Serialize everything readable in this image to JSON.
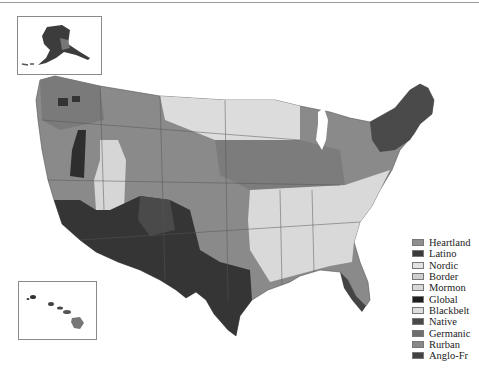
{
  "map": {
    "title": "",
    "subject": "US counties by cultural region",
    "insets": [
      "Alaska",
      "Hawaii"
    ]
  },
  "legend": {
    "items": [
      {
        "label": "Heartland",
        "color": "#8e8e8e"
      },
      {
        "label": "Latino",
        "color": "#3a3a3a"
      },
      {
        "label": "Nordic",
        "color": "#e2e2e2"
      },
      {
        "label": "Border",
        "color": "#cfcfcf"
      },
      {
        "label": "Mormon",
        "color": "#d8d8d8"
      },
      {
        "label": "Global",
        "color": "#1e1e1e"
      },
      {
        "label": "Blackbelt",
        "color": "#dedede"
      },
      {
        "label": "Native",
        "color": "#4a4a4a"
      },
      {
        "label": "Germanic",
        "color": "#6e6e6e"
      },
      {
        "label": "Rurban",
        "color": "#888888"
      },
      {
        "label": "Anglo-Fr",
        "color": "#424242"
      }
    ]
  }
}
